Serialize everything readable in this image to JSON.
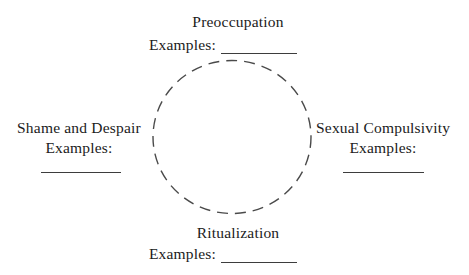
{
  "diagram": {
    "type": "cycle-diagram",
    "shape": "dashed-circle",
    "colors": {
      "background": "#ffffff",
      "text": "#1b1b1b",
      "line": "#3d3d3d",
      "circle_stroke": "#4a4a4a"
    },
    "stages": {
      "top": {
        "label": "Preoccupation",
        "examples_label": "Examples:",
        "blank_value": ""
      },
      "right": {
        "label": "Sexual Compulsivity",
        "examples_label": "Examples:",
        "blank_value": ""
      },
      "bottom": {
        "label": "Ritualization",
        "examples_label": "Examples:",
        "blank_value": ""
      },
      "left": {
        "label": "Shame and Despair",
        "examples_label": "Examples:",
        "blank_value": ""
      }
    }
  }
}
